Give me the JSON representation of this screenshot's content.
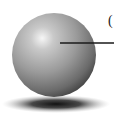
{
  "diagram": {
    "label_fragment": "(",
    "colors": {
      "sphere_highlight": "#f4f4f4",
      "sphere_mid": "#9a9a9a",
      "sphere_shadow": "#3a3a3a",
      "ground_shadow": "#1e1e1e",
      "leader_line": "#1a1a1a",
      "background": "#ffffff"
    }
  }
}
